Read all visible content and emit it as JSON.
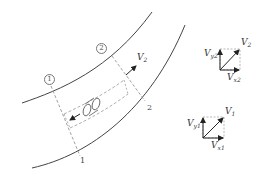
{
  "diagram": {
    "type": "streamtube-flow-in-curved-channel",
    "sections": [
      {
        "id": "1",
        "circled_label": "1",
        "plain_label": "1"
      },
      {
        "id": "2",
        "circled_label": "2",
        "plain_label": "2"
      }
    ],
    "flow_velocity_label": {
      "base": "V",
      "sub": "2"
    },
    "vector_diagrams": [
      {
        "name": "section-2-velocity",
        "resultant": {
          "base": "V",
          "sub": "2"
        },
        "y_component": {
          "base": "V",
          "sub": "y2"
        },
        "x_component": {
          "base": "V",
          "sub": "x2"
        }
      },
      {
        "name": "section-1-velocity",
        "resultant": {
          "base": "V",
          "sub": "1"
        },
        "y_component": {
          "base": "V",
          "sub": "y1"
        },
        "x_component": {
          "base": "V",
          "sub": "x1"
        }
      }
    ],
    "colors": {
      "stroke": "#333333",
      "dashed": "#888888",
      "background": "#ffffff"
    }
  }
}
